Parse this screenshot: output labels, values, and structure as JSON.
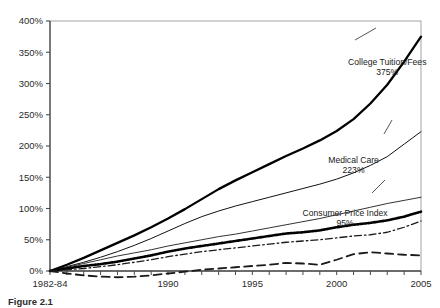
{
  "figure": {
    "caption": "Figure 2.1",
    "background": "#ffffff"
  },
  "chart_data": {
    "type": "line",
    "title": "",
    "subtitle": "",
    "xlabel": "",
    "ylabel": "",
    "grid": false,
    "legend_position": "inline-annotations",
    "xlim": [
      1983,
      2005
    ],
    "ylim": [
      0,
      400
    ],
    "ytick_labels": [
      "0%",
      "50%",
      "100%",
      "150%",
      "200%",
      "250%",
      "300%",
      "350%",
      "400%"
    ],
    "ytick_values": [
      0,
      50,
      100,
      150,
      200,
      250,
      300,
      350,
      400
    ],
    "xtick_labels": [
      "1982-84",
      "1990",
      "1995",
      "2000",
      "2005"
    ],
    "xtick_values": [
      1983,
      1990,
      1995,
      2000,
      2005
    ],
    "x": [
      1983,
      1984,
      1985,
      1986,
      1987,
      1988,
      1989,
      1990,
      1991,
      1992,
      1993,
      1994,
      1995,
      1996,
      1997,
      1998,
      1999,
      2000,
      2001,
      2002,
      2003,
      2004,
      2005
    ],
    "series": [
      {
        "name": "College Tuition/Fees",
        "end_value": 375,
        "end_label": "375%",
        "style": "solid-thick",
        "color": "#000000",
        "width": 2.3,
        "labeled": true,
        "values": [
          0,
          10,
          21,
          33,
          45,
          57,
          70,
          84,
          99,
          115,
          131,
          145,
          158,
          171,
          184,
          196,
          209,
          224,
          243,
          268,
          298,
          335,
          375
        ]
      },
      {
        "name": "Medical Care",
        "end_value": 223,
        "end_label": "223%",
        "style": "solid-thin",
        "color": "#111111",
        "width": 1.0,
        "labeled": true,
        "values": [
          0,
          7,
          14,
          22,
          31,
          41,
          52,
          64,
          76,
          87,
          96,
          104,
          111,
          118,
          125,
          132,
          139,
          147,
          157,
          169,
          183,
          203,
          223
        ]
      },
      {
        "name": "unlabeled-series-3",
        "end_value": 118,
        "end_label": "",
        "style": "solid-thin",
        "color": "#333333",
        "width": 1.0,
        "labeled": false,
        "values": [
          0,
          6,
          12,
          18,
          24,
          29,
          34,
          40,
          45,
          50,
          55,
          59,
          64,
          69,
          74,
          79,
          84,
          90,
          96,
          102,
          108,
          113,
          118
        ]
      },
      {
        "name": "Consumer Price Index",
        "end_value": 95,
        "end_label": "95%",
        "style": "dotted-thick",
        "color": "#000000",
        "width": 2.6,
        "labeled": true,
        "values": [
          0,
          4,
          8,
          11,
          15,
          20,
          25,
          31,
          36,
          40,
          44,
          48,
          52,
          56,
          60,
          62,
          65,
          70,
          74,
          77,
          81,
          87,
          95
        ]
      },
      {
        "name": "unlabeled-series-5",
        "end_value": 80,
        "end_label": "",
        "style": "dash-dot",
        "color": "#1a1a1a",
        "width": 1.3,
        "labeled": false,
        "values": [
          0,
          2,
          4,
          7,
          10,
          14,
          18,
          23,
          27,
          31,
          34,
          37,
          40,
          43,
          46,
          48,
          50,
          53,
          56,
          58,
          62,
          70,
          80
        ]
      },
      {
        "name": "unlabeled-series-6",
        "end_value": 25,
        "end_label": "",
        "style": "long-dash",
        "color": "#1a1a1a",
        "width": 1.8,
        "labeled": false,
        "values": [
          0,
          -4,
          -7,
          -9,
          -10,
          -9,
          -7,
          -4,
          -1,
          2,
          4,
          6,
          8,
          10,
          13,
          12,
          10,
          18,
          27,
          30,
          28,
          26,
          25
        ]
      }
    ],
    "annotations": [
      {
        "name": "College Tuition/Fees",
        "value_label": "375%",
        "at_x": 2003,
        "at_y": 330
      },
      {
        "name": "Medical Care",
        "value_label": "223%",
        "at_x": 2001,
        "at_y": 173
      },
      {
        "name": "Consumer Price Index",
        "value_label": "95%",
        "at_x": 2000.5,
        "at_y": 88
      }
    ]
  }
}
